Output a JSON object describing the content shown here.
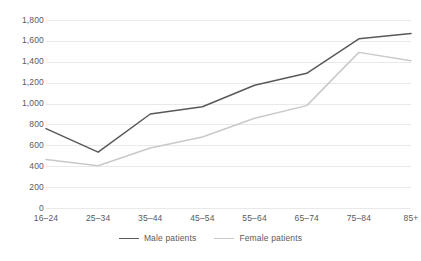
{
  "chart_data": {
    "type": "line",
    "title": "",
    "subtitle": "",
    "xlabel": "",
    "ylabel": "",
    "categories": [
      "16–24",
      "25–34",
      "35–44",
      "45–54",
      "55–64",
      "65–74",
      "75–84",
      "85+"
    ],
    "series": [
      {
        "name": "Male patients",
        "color": "#595959",
        "values": [
          760,
          535,
          900,
          970,
          1175,
          1290,
          1620,
          1670
        ]
      },
      {
        "name": "Female patients",
        "color": "#c9c9c9",
        "values": [
          465,
          405,
          575,
          680,
          860,
          980,
          1490,
          1410
        ]
      }
    ],
    "ylim": [
      0,
      1800
    ],
    "ytick_values": [
      0,
      200,
      400,
      600,
      800,
      1000,
      1200,
      1400,
      1600,
      1800
    ],
    "ytick_labels": [
      "0",
      "200",
      "400",
      "600",
      "800",
      "1,000",
      "1,200",
      "1,400",
      "1,600",
      "1,800"
    ],
    "grid": true,
    "grid_axis": "y",
    "legend_position": "bottom",
    "legend_entries": [
      "Male patients",
      "Female patients"
    ]
  },
  "colors": {
    "male_line": "#595959",
    "female_line": "#c9c9c9",
    "gridline": "#e9e9e9",
    "text": "#5a5a5a",
    "background": "#ffffff"
  }
}
